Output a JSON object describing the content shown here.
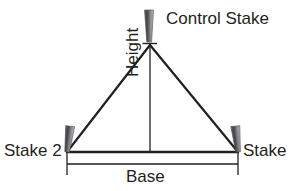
{
  "diagram": {
    "background_color": "#ffffff",
    "line_color": "#231f20",
    "text_color": "#231f20",
    "stake_dark_color": "#58595b",
    "stake_light_color": "#a7a9ac",
    "labels": {
      "control_stake": "Control Stake",
      "stake_2": "Stake 2",
      "stake_right": "Stake",
      "base": "Base",
      "height": "Height"
    },
    "icons": {
      "stake": "stake-icon"
    },
    "geometry": {
      "apex_x": 150,
      "apex_y": 45,
      "left_vertex_x": 67,
      "left_vertex_y": 152,
      "right_vertex_x": 238,
      "right_vertex_y": 152,
      "base_dimension_y": 164,
      "height_line_x": 150
    }
  }
}
